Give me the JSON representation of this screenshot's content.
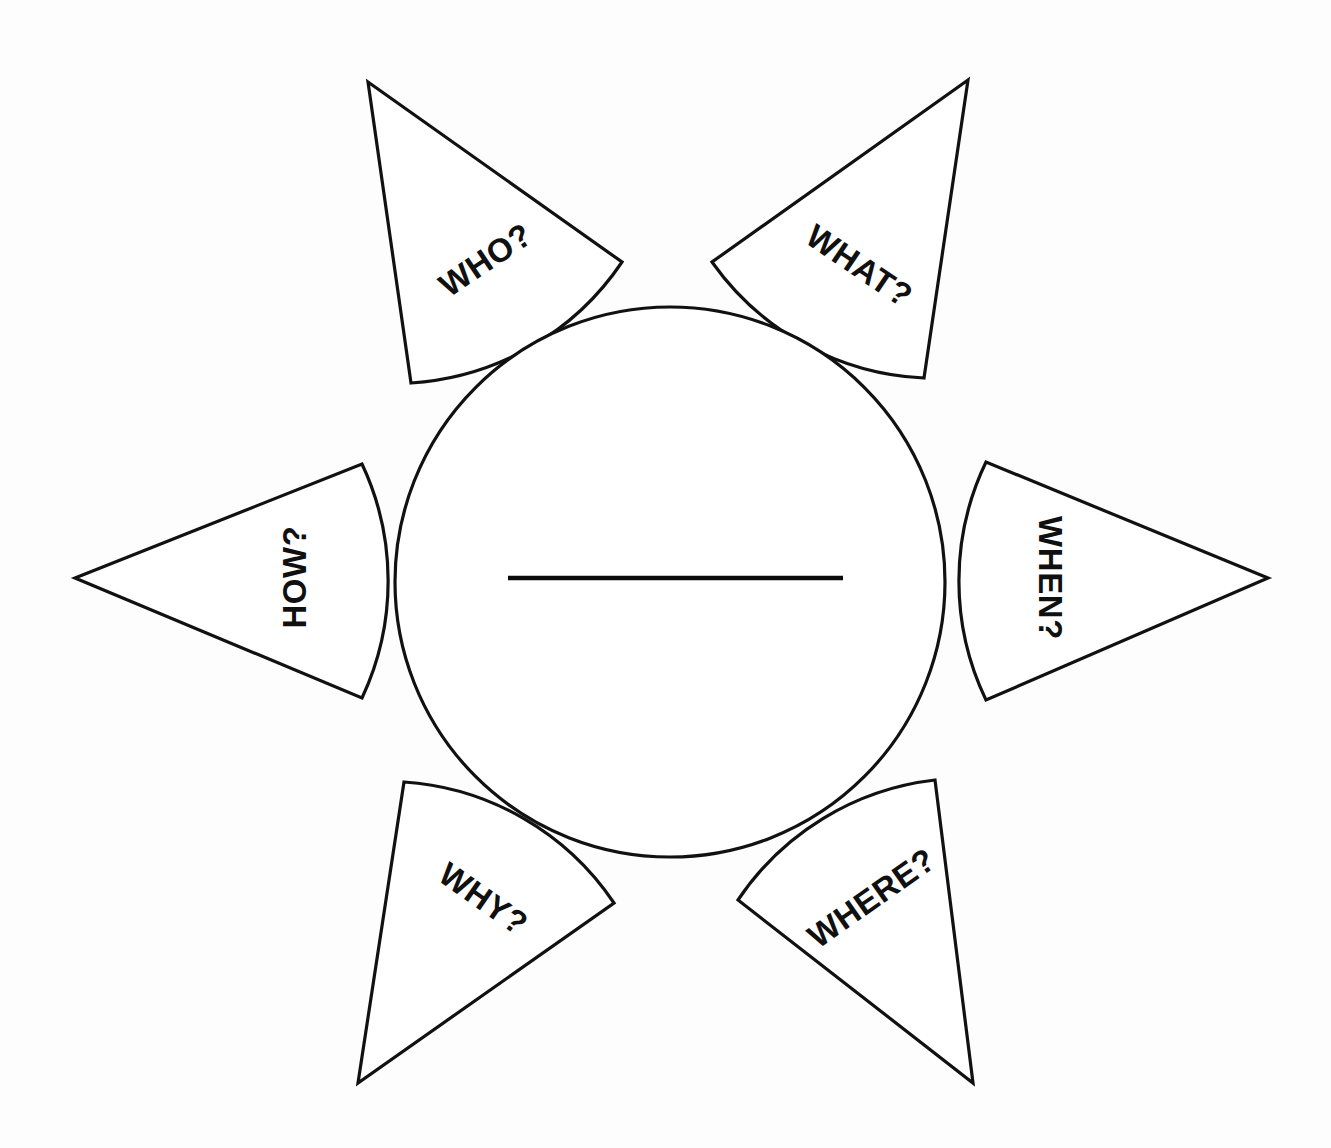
{
  "diagram": {
    "type": "radial-petal-diagram",
    "background_color": "#fdfdfd",
    "line_color": "#111111",
    "text_color": "#101010",
    "center": {
      "shape": "circle",
      "name": "topic-circle",
      "cx": 670,
      "cy": 582,
      "r": 275,
      "fill": "#ffffff",
      "writing_rule": {
        "name": "topic-write-in-line",
        "x1": 508,
        "x2": 843,
        "y": 578,
        "label": ""
      }
    },
    "petals": [
      {
        "id": "who",
        "label": "WHO?",
        "direction": "upper-left",
        "tip": {
          "x": 368,
          "y": 82
        },
        "base_points": [
          {
            "x": 622,
            "y": 262
          },
          {
            "x": 411,
            "y": 383
          }
        ],
        "label_x": 487,
        "label_y": 262,
        "label_rotation": -34
      },
      {
        "id": "what",
        "label": "WHAT?",
        "direction": "upper-right",
        "tip": {
          "x": 968,
          "y": 80
        },
        "base_points": [
          {
            "x": 712,
            "y": 262
          },
          {
            "x": 924,
            "y": 378
          }
        ],
        "label_x": 858,
        "label_y": 268,
        "label_rotation": 34
      },
      {
        "id": "how",
        "label": "HOW?",
        "direction": "left",
        "tip": {
          "x": 75,
          "y": 578
        },
        "base_points": [
          {
            "x": 362,
            "y": 464
          },
          {
            "x": 362,
            "y": 698
          }
        ],
        "label_x": 297,
        "label_y": 577,
        "label_rotation": -90
      },
      {
        "id": "when",
        "label": "WHEN?",
        "direction": "right",
        "tip": {
          "x": 1268,
          "y": 578
        },
        "base_points": [
          {
            "x": 986,
            "y": 462
          },
          {
            "x": 986,
            "y": 700
          }
        ],
        "label_x": 1048,
        "label_y": 578,
        "label_rotation": 90
      },
      {
        "id": "why",
        "label": "WHY?",
        "direction": "lower-left",
        "tip": {
          "x": 358,
          "y": 1083
        },
        "base_points": [
          {
            "x": 404,
            "y": 782
          },
          {
            "x": 614,
            "y": 903
          }
        ],
        "label_x": 482,
        "label_y": 901,
        "label_rotation": 35
      },
      {
        "id": "where",
        "label": "WHERE?",
        "direction": "lower-right",
        "tip": {
          "x": 973,
          "y": 1083
        },
        "base_points": [
          {
            "x": 935,
            "y": 780
          },
          {
            "x": 738,
            "y": 900
          }
        ],
        "label_x": 873,
        "label_y": 900,
        "label_rotation": -35
      }
    ]
  }
}
